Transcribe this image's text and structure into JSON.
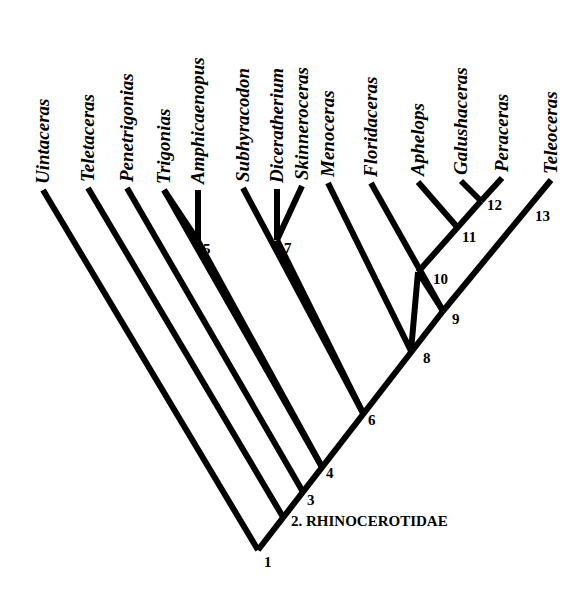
{
  "diagram": {
    "type": "cladogram",
    "clade_label": "2. RHINOCEROTIDAE",
    "taxa": [
      {
        "name": "Uintaceras",
        "tip": [
          43,
          190
        ],
        "base": [
          258,
          550
        ]
      },
      {
        "name": "Teletaceras",
        "tip": [
          88,
          188
        ],
        "base": [
          283,
          517
        ]
      },
      {
        "name": "Penetrigonias",
        "tip": [
          127,
          188
        ],
        "base": [
          303,
          492
        ]
      },
      {
        "name": "Trigonias",
        "tip": [
          164,
          190
        ],
        "base": [
          322,
          467
        ]
      },
      {
        "name": "Amphicaenopus",
        "tip": [
          198,
          190
        ],
        "base": [
          198,
          241
        ]
      },
      {
        "name": "Subhyracodon",
        "tip": [
          243,
          188
        ],
        "base": [
          363,
          413
        ]
      },
      {
        "name": "Diceratherium",
        "tip": [
          277,
          189
        ],
        "base": [
          277,
          240
        ]
      },
      {
        "name": "Skinneroceras",
        "tip": [
          302,
          186
        ],
        "base": [
          277,
          240
        ]
      },
      {
        "name": "Menoceras",
        "tip": [
          328,
          183
        ],
        "base": [
          411,
          351
        ]
      },
      {
        "name": "Floridaceras",
        "tip": [
          371,
          183
        ],
        "base": [
          443,
          311
        ]
      },
      {
        "name": "Aphelops",
        "tip": [
          418,
          182
        ],
        "base": [
          458,
          228
        ]
      },
      {
        "name": "Galushaceras",
        "tip": [
          461,
          181
        ],
        "base": [
          481,
          201
        ]
      },
      {
        "name": "Peraceras",
        "tip": [
          502,
          178
        ],
        "base": [
          481,
          201
        ]
      },
      {
        "name": "Teleoceras",
        "tip": [
          551,
          180
        ],
        "base": [
          443,
          311
        ]
      }
    ],
    "internal_branches": [
      {
        "from": [
          258,
          550
        ],
        "to": [
          443,
          311
        ]
      },
      {
        "from": [
          164,
          190
        ],
        "to": [
          198,
          241
        ]
      },
      {
        "from": [
          198,
          241
        ],
        "to": [
          322,
          467
        ]
      },
      {
        "from": [
          277,
          240
        ],
        "to": [
          363,
          413
        ]
      },
      {
        "from": [
          411,
          351
        ],
        "to": [
          418,
          272
        ]
      },
      {
        "from": [
          443,
          311
        ],
        "to": [
          418,
          272
        ]
      },
      {
        "from": [
          418,
          272
        ],
        "to": [
          481,
          201
        ]
      }
    ],
    "nodes": [
      {
        "label": "1",
        "x": 264,
        "y": 567
      },
      {
        "label": "3",
        "x": 307,
        "y": 505
      },
      {
        "label": "4",
        "x": 326,
        "y": 478
      },
      {
        "label": "5",
        "x": 203,
        "y": 254
      },
      {
        "label": "6",
        "x": 368,
        "y": 425
      },
      {
        "label": "7",
        "x": 284,
        "y": 253
      },
      {
        "label": "8",
        "x": 423,
        "y": 363
      },
      {
        "label": "9",
        "x": 452,
        "y": 324
      },
      {
        "label": "10",
        "x": 433,
        "y": 284
      },
      {
        "label": "11",
        "x": 462,
        "y": 242
      },
      {
        "label": "12",
        "x": 487,
        "y": 210
      },
      {
        "label": "13",
        "x": 535,
        "y": 221
      }
    ],
    "clade_label_pos": {
      "x": 291,
      "y": 526
    }
  }
}
